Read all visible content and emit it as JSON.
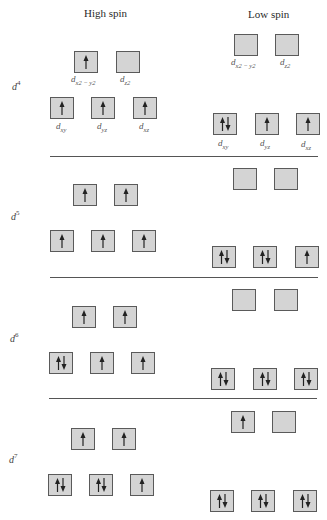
{
  "header": {
    "high_spin": "High spin",
    "low_spin": "Low spin"
  },
  "orbital_labels": {
    "dx2y2": "d",
    "dx2y2_sub": "x2 − y2",
    "dz2": "d",
    "dz2_sub": "z2",
    "dxy": "d",
    "dxy_sub": "xy",
    "dyz": "d",
    "dyz_sub": "yz",
    "dxz": "d",
    "dxz_sub": "xz"
  },
  "configurations": [
    {
      "label": "d",
      "exponent": "4",
      "high_spin": {
        "eg": [
          "up",
          "empty"
        ],
        "t2g": [
          "up",
          "up",
          "up"
        ]
      },
      "low_spin": {
        "eg": [
          "empty",
          "empty"
        ],
        "t2g": [
          "pair",
          "up",
          "up"
        ]
      }
    },
    {
      "label": "d",
      "exponent": "5",
      "high_spin": {
        "eg": [
          "up",
          "up"
        ],
        "t2g": [
          "up",
          "up",
          "up"
        ]
      },
      "low_spin": {
        "eg": [
          "empty",
          "empty"
        ],
        "t2g": [
          "pair",
          "pair",
          "up"
        ]
      }
    },
    {
      "label": "d",
      "exponent": "6",
      "high_spin": {
        "eg": [
          "up",
          "up"
        ],
        "t2g": [
          "pair",
          "up",
          "up"
        ]
      },
      "low_spin": {
        "eg": [
          "empty",
          "empty"
        ],
        "t2g": [
          "pair",
          "pair",
          "pair"
        ]
      }
    },
    {
      "label": "d",
      "exponent": "7",
      "high_spin": {
        "eg": [
          "up",
          "up"
        ],
        "t2g": [
          "pair",
          "pair",
          "up"
        ]
      },
      "low_spin": {
        "eg": [
          "up",
          "empty"
        ],
        "t2g": [
          "pair",
          "pair",
          "pair"
        ]
      }
    }
  ],
  "colors": {
    "box_fill": "#d4d4d4",
    "box_border": "#5a5a5a",
    "arrow": "#222222",
    "divider": "#555555"
  }
}
